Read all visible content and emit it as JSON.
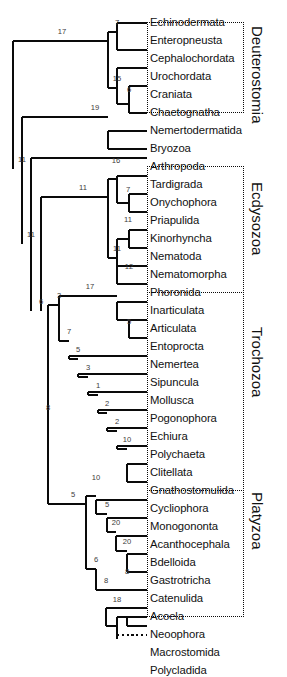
{
  "figure": {
    "type": "phylogenetic-cladogram",
    "width": 287,
    "height": 639,
    "line_color": "#0a0a0a",
    "text_color": "#111111",
    "node_label_color": "#3b3b3b",
    "background": "#ffffff"
  },
  "taxa": [
    {
      "name": "Echinodermata",
      "y": 32
    },
    {
      "name": "Enteropneusta",
      "y": 50
    },
    {
      "name": "Cephalochordata",
      "y": 68
    },
    {
      "name": "Urochordata",
      "y": 86
    },
    {
      "name": "Craniata",
      "y": 104
    },
    {
      "name": "Chaetognatha",
      "y": 122
    },
    {
      "name": "Nemertodermatida",
      "y": 140
    },
    {
      "name": "Bryozoa",
      "y": 158
    },
    {
      "name": "Arthropoda",
      "y": 176
    },
    {
      "name": "Tardigrada",
      "y": 194
    },
    {
      "name": "Onychophora",
      "y": 212
    },
    {
      "name": "Priapulida",
      "y": 230
    },
    {
      "name": "Kinorhyncha",
      "y": 248
    },
    {
      "name": "Nematoda",
      "y": 266
    },
    {
      "name": "Nematomorpha",
      "y": 284
    },
    {
      "name": "Phoronida",
      "y": 302
    },
    {
      "name": "Inarticulata",
      "y": 320
    },
    {
      "name": "Articulata",
      "y": 338
    },
    {
      "name": "Entoprocta",
      "y": 356
    },
    {
      "name": "Nemertea",
      "y": 374
    },
    {
      "name": "Sipuncula",
      "y": 392
    },
    {
      "name": "Mollusca",
      "y": 410
    },
    {
      "name": "Pogonophora",
      "y": 428
    },
    {
      "name": "Echiura",
      "y": 446
    },
    {
      "name": "Polychaeta",
      "y": 464
    },
    {
      "name": "Clitellata",
      "y": 482
    },
    {
      "name": "Gnathostomulida",
      "y": 500
    },
    {
      "name": "Cycliophora",
      "y": 518
    },
    {
      "name": "Monogononta",
      "y": 536
    },
    {
      "name": "Acanthocephala",
      "y": 554
    },
    {
      "name": "Bdelloida",
      "y": 572
    },
    {
      "name": "Gastrotricha",
      "y": 590
    },
    {
      "name": "Catenulida",
      "y": 608
    },
    {
      "name": "Acoela",
      "y": 626
    },
    {
      "name": "Neoophora",
      "y": 644
    },
    {
      "name": "Macrostomida",
      "y": 662
    },
    {
      "name": "Polycladida",
      "y": 680
    }
  ],
  "node_supports": [
    {
      "value": "17",
      "x": 62,
      "y": 41
    },
    {
      "value": "7",
      "x": 117,
      "y": 32
    },
    {
      "value": "15",
      "x": 117,
      "y": 88
    },
    {
      "value": "6",
      "x": 129,
      "y": 99
    },
    {
      "value": "19",
      "x": 95,
      "y": 117
    },
    {
      "value": "11",
      "x": 22,
      "y": 169
    },
    {
      "value": "11",
      "x": 31,
      "y": 244
    },
    {
      "value": "11",
      "x": 83,
      "y": 197
    },
    {
      "value": "16",
      "x": 116,
      "y": 170
    },
    {
      "value": "7",
      "x": 128,
      "y": 199
    },
    {
      "value": "11",
      "x": 128,
      "y": 229
    },
    {
      "value": "11",
      "x": 117,
      "y": 258
    },
    {
      "value": "12",
      "x": 129,
      "y": 276
    },
    {
      "value": "6",
      "x": 41,
      "y": 311
    },
    {
      "value": "3",
      "x": 59,
      "y": 305
    },
    {
      "value": "17",
      "x": 90,
      "y": 296
    },
    {
      "value": "5",
      "x": 129,
      "y": 331
    },
    {
      "value": "7",
      "x": 69,
      "y": 341
    },
    {
      "value": "5",
      "x": 78,
      "y": 359
    },
    {
      "value": "3",
      "x": 88,
      "y": 377
    },
    {
      "value": "1",
      "x": 98,
      "y": 395
    },
    {
      "value": "2",
      "x": 107,
      "y": 413
    },
    {
      "value": "2",
      "x": 117,
      "y": 431
    },
    {
      "value": "10",
      "x": 127,
      "y": 449
    },
    {
      "value": "8",
      "x": 48,
      "y": 417
    },
    {
      "value": "5",
      "x": 73,
      "y": 504
    },
    {
      "value": "10",
      "x": 96,
      "y": 487
    },
    {
      "value": "5",
      "x": 107,
      "y": 514
    },
    {
      "value": "20",
      "x": 116,
      "y": 532
    },
    {
      "value": "20",
      "x": 127,
      "y": 551
    },
    {
      "value": "6",
      "x": 96,
      "y": 569
    },
    {
      "value": "8",
      "x": 106,
      "y": 590
    },
    {
      "value": "8",
      "x": 127,
      "y": 581
    },
    {
      "value": "18",
      "x": 117,
      "y": 609
    }
  ],
  "clade_boxes": [
    {
      "label": "Deuterostomia",
      "left": 147,
      "top": 22,
      "width": 97,
      "height": 91,
      "label_x": 265,
      "label_y": 26
    },
    {
      "label": "Ecdysozoa",
      "left": 147,
      "top": 166,
      "width": 97,
      "height": 127,
      "label_x": 265,
      "label_y": 182
    },
    {
      "label": "Trochozoa",
      "left": 147,
      "top": 292,
      "width": 97,
      "height": 199,
      "label_x": 265,
      "label_y": 327
    },
    {
      "label": "Platyzoa",
      "left": 147,
      "top": 490,
      "width": 97,
      "height": 127,
      "label_x": 265,
      "label_y": 492
    }
  ],
  "dotted_branch": {
    "taxon": "Macrostomida",
    "support": "18"
  }
}
